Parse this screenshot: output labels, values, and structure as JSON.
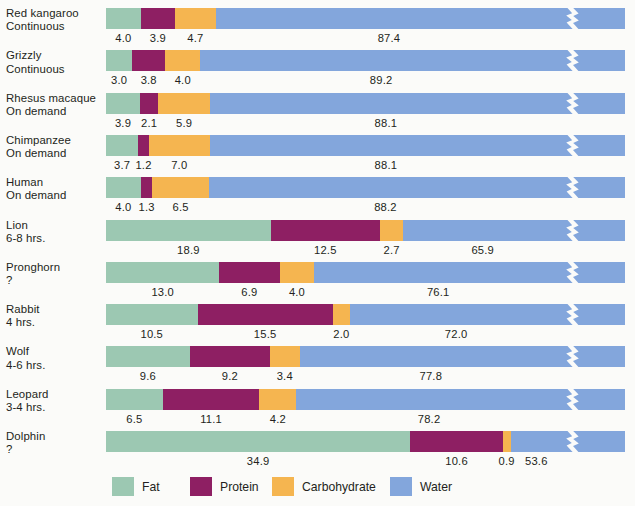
{
  "chart_data": {
    "type": "bar",
    "subtype": "stacked-horizontal",
    "title": "",
    "xlabel": "",
    "ylabel": "",
    "grid": false,
    "axis_break": true,
    "axis_break_note": "Water segment is truncated with a zig-zag break; printed value shows true percentage.",
    "legend_position": "bottom",
    "series": [
      {
        "name": "Fat",
        "color": "#9cc8b2"
      },
      {
        "name": "Protein",
        "color": "#8e1f63"
      },
      {
        "name": "Carbohydrate",
        "color": "#f5b550"
      },
      {
        "name": "Water",
        "color": "#83a6dc"
      }
    ],
    "categories": [
      "Red kangaroo",
      "Grizzly",
      "Rhesus macaque",
      "Chimpanzee",
      "Human",
      "Lion",
      "Pronghorn",
      "Rabbit",
      "Wolf",
      "Leopard",
      "Dolphin"
    ],
    "rows": [
      {
        "animal": "Red kangaroo",
        "interval": "Continuous",
        "fat": 4.0,
        "protein": 3.9,
        "carbohydrate": 4.7,
        "water": 87.4
      },
      {
        "animal": "Grizzly",
        "interval": "Continuous",
        "fat": 3.0,
        "protein": 3.8,
        "carbohydrate": 4.0,
        "water": 89.2
      },
      {
        "animal": "Rhesus macaque",
        "interval": "On demand",
        "fat": 3.9,
        "protein": 2.1,
        "carbohydrate": 5.9,
        "water": 88.1
      },
      {
        "animal": "Chimpanzee",
        "interval": "On demand",
        "fat": 3.7,
        "protein": 1.2,
        "carbohydrate": 7.0,
        "water": 88.1
      },
      {
        "animal": "Human",
        "interval": "On demand",
        "fat": 4.0,
        "protein": 1.3,
        "carbohydrate": 6.5,
        "water": 88.2
      },
      {
        "animal": "Lion",
        "interval": "6-8 hrs.",
        "fat": 18.9,
        "protein": 12.5,
        "carbohydrate": 2.7,
        "water": 65.9
      },
      {
        "animal": "Pronghorn",
        "interval": "?",
        "fat": 13.0,
        "protein": 6.9,
        "carbohydrate": 4.0,
        "water": 76.1
      },
      {
        "animal": "Rabbit",
        "interval": "4 hrs.",
        "fat": 10.5,
        "protein": 15.5,
        "carbohydrate": 2.0,
        "water": 72.0
      },
      {
        "animal": "Wolf",
        "interval": "4-6 hrs.",
        "fat": 9.6,
        "protein": 9.2,
        "carbohydrate": 3.4,
        "water": 77.8
      },
      {
        "animal": "Leopard",
        "interval": "3-4 hrs.",
        "fat": 6.5,
        "protein": 11.1,
        "carbohydrate": 4.2,
        "water": 78.2
      },
      {
        "animal": "Dolphin",
        "interval": "?",
        "fat": 34.9,
        "protein": 10.6,
        "carbohydrate": 0.9,
        "water": 53.6
      }
    ],
    "value_labels": [
      {
        "fat": "4.0",
        "protein": "3.9",
        "carbohydrate": "4.7",
        "water": "87.4"
      },
      {
        "fat": "3.0",
        "protein": "3.8",
        "carbohydrate": "4.0",
        "water": "89.2"
      },
      {
        "fat": "3.9",
        "protein": "2.1",
        "carbohydrate": "5.9",
        "water": "88.1"
      },
      {
        "fat": "3.7",
        "protein": "1.2",
        "carbohydrate": "7.0",
        "water": "88.1"
      },
      {
        "fat": "4.0",
        "protein": "1.3",
        "carbohydrate": "6.5",
        "water": "88.2"
      },
      {
        "fat": "18.9",
        "protein": "12.5",
        "carbohydrate": "2.7",
        "water": "65.9"
      },
      {
        "fat": "13.0",
        "protein": "6.9",
        "carbohydrate": "4.0",
        "water": "76.1"
      },
      {
        "fat": "10.5",
        "protein": "15.5",
        "carbohydrate": "2.0",
        "water": "72.0"
      },
      {
        "fat": "9.6",
        "protein": "9.2",
        "carbohydrate": "3.4",
        "water": "77.8"
      },
      {
        "fat": "6.5",
        "protein": "11.1",
        "carbohydrate": "4.2",
        "water": "78.2"
      },
      {
        "fat": "34.9",
        "protein": "10.6",
        "carbohydrate": "0.9",
        "water": "53.6"
      }
    ]
  },
  "legend": {
    "items": [
      {
        "label": "Fat",
        "color": "#9cc8b2"
      },
      {
        "label": "Protein",
        "color": "#8e1f63"
      },
      {
        "label": "Carbohydrate",
        "color": "#f5b550"
      },
      {
        "label": "Water",
        "color": "#83a6dc"
      }
    ]
  }
}
